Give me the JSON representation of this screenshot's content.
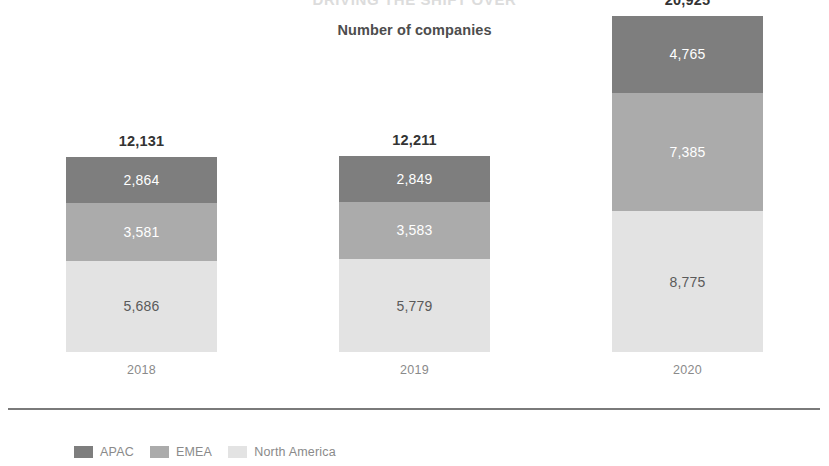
{
  "chart_data": {
    "type": "bar",
    "subtype": "stacked-bar",
    "title": "DRIVING THE SHIFT OVER",
    "subtitle": "Number of companies",
    "xlabel": "",
    "ylabel": "",
    "categories": [
      "2018",
      "2019",
      "2020"
    ],
    "series": [
      {
        "name": "North America",
        "color": "#e3e3e3",
        "values": [
          5686,
          5779,
          8775
        ],
        "value_labels": [
          "5,686",
          "5,779",
          "8,775"
        ],
        "stack_position": "bottom",
        "label_color": "#5a5a5a"
      },
      {
        "name": "EMEA",
        "color": "#ababab",
        "values": [
          3581,
          3583,
          7385
        ],
        "value_labels": [
          "3,581",
          "3,583",
          "7,385"
        ],
        "stack_position": "middle",
        "label_color": "#ffffff"
      },
      {
        "name": "APAC",
        "color": "#7e7e7e",
        "values": [
          2864,
          2849,
          4765
        ],
        "value_labels": [
          "2,864",
          "2,849",
          "4,765"
        ],
        "stack_position": "top",
        "label_color": "#ffffff"
      }
    ],
    "totals": [
      12131,
      12211,
      20925
    ],
    "total_labels": [
      "12,131",
      "12,211",
      "20,925"
    ],
    "ylim": [
      0,
      20925
    ],
    "grid": false,
    "legend_position": "bottom-left",
    "legend_order": [
      "APAC",
      "EMEA",
      "North America"
    ]
  },
  "legend": {
    "items": [
      {
        "label": "APAC",
        "color": "#7e7e7e"
      },
      {
        "label": "EMEA",
        "color": "#ababab"
      },
      {
        "label": "North America",
        "color": "#e3e3e3"
      }
    ]
  },
  "axis": {
    "category_labels": [
      "2018",
      "2019",
      "2020"
    ]
  }
}
